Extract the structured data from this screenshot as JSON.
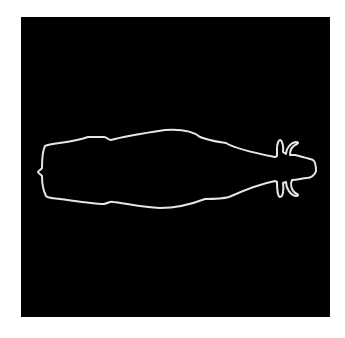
{
  "artwork": {
    "subject": "bull-top-view-outline",
    "background_color": "#000000",
    "outline_color": "#e6e6e6",
    "year_start": "1993",
    "year_end": "2023"
  }
}
